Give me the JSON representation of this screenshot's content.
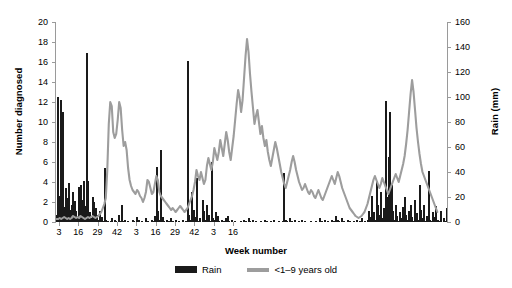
{
  "chart_data": {
    "type": "bar",
    "title": "",
    "xlabel": "Week number",
    "ylabel": "Number diagnosed",
    "ylabel_right": "Rain (mm)",
    "ylim": [
      0,
      20
    ],
    "ylim_right": [
      0,
      160
    ],
    "yticks": [
      0,
      2,
      4,
      6,
      8,
      10,
      12,
      14,
      16,
      18,
      20
    ],
    "yticks_right": [
      0,
      20,
      40,
      60,
      80,
      100,
      120,
      140,
      160
    ],
    "xticks": [
      3,
      16,
      29,
      42,
      3,
      16,
      29,
      42,
      3,
      16
    ],
    "xtick_positions": [
      3,
      16,
      29,
      42,
      55,
      68,
      81,
      94,
      107,
      120
    ],
    "grid": false,
    "legend_position": "bottom-center",
    "series": [
      {
        "name": "Rain",
        "type": "bar",
        "color": "#1a1a1a",
        "axis": "right",
        "unit": "mm",
        "values": [
          6,
          100,
          21,
          98,
          88,
          12,
          27,
          19,
          31,
          10,
          14,
          24,
          17,
          9,
          5,
          28,
          30,
          18,
          33,
          13,
          135,
          33,
          8,
          3,
          20,
          16,
          11,
          6,
          2,
          9,
          4,
          1,
          43,
          2,
          1,
          0,
          1,
          3,
          0,
          2,
          1,
          0,
          6,
          1,
          14,
          1,
          2,
          0,
          1,
          0,
          0,
          2,
          1,
          0,
          4,
          2,
          0,
          1,
          0,
          0,
          3,
          1,
          0,
          0,
          2,
          1,
          5,
          44,
          9,
          2,
          58,
          4,
          1,
          0,
          2,
          1,
          0,
          3,
          1,
          0,
          2,
          0,
          1,
          0,
          0,
          2,
          0,
          1,
          129,
          6,
          2,
          24,
          10,
          4,
          35,
          1,
          3,
          0,
          18,
          9,
          2,
          14,
          6,
          1,
          48,
          3,
          2,
          8,
          5,
          1,
          0,
          2,
          1,
          0,
          3,
          5,
          1,
          0,
          2,
          0,
          1,
          0,
          0,
          0,
          1,
          0,
          2,
          1,
          0,
          3,
          1,
          0,
          2,
          0,
          1,
          0,
          0,
          1,
          0,
          0,
          2,
          1,
          0,
          0,
          1,
          0,
          2,
          0,
          0,
          1,
          0,
          0,
          1,
          39,
          2,
          1,
          0,
          3,
          1,
          0,
          2,
          0,
          0,
          1,
          0,
          2,
          0,
          1,
          0,
          0,
          0,
          1,
          0,
          0,
          1,
          0,
          0,
          3,
          1,
          0,
          2,
          0,
          1,
          0,
          0,
          2,
          1,
          0,
          5,
          2,
          1,
          0,
          3,
          1,
          0,
          0,
          2,
          1,
          0,
          0,
          1,
          0,
          2,
          0,
          1,
          3,
          0,
          1,
          0,
          2,
          9,
          4,
          21,
          8,
          2,
          33,
          14,
          6,
          24,
          3,
          11,
          97,
          20,
          52,
          88,
          30,
          9,
          2,
          14,
          5,
          1,
          8,
          3,
          12,
          20,
          6,
          2,
          9,
          14,
          4,
          1,
          18,
          7,
          2,
          30,
          10,
          3,
          14,
          1,
          5,
          41,
          2,
          1,
          8,
          4,
          13,
          2,
          1,
          9,
          0,
          3,
          1,
          11
        ]
      },
      {
        "name": "<1–9 years old",
        "type": "line",
        "color": "#9d9d9d",
        "axis": "left",
        "unit": "cases",
        "values": [
          0.3,
          0.3,
          0.4,
          0.3,
          0.4,
          0.5,
          0.4,
          0.3,
          0.4,
          0.3,
          0.4,
          0.6,
          0.5,
          0.4,
          0.5,
          0.4,
          0.6,
          0.5,
          0.4,
          0.3,
          0.4,
          0.5,
          0.4,
          0.5,
          0.6,
          0.5,
          0.4,
          0.5,
          0.6,
          0.8,
          1.0,
          1.4,
          1.8,
          2.4,
          5.2,
          9.8,
          12.0,
          11.6,
          9.0,
          8.4,
          8.8,
          10.2,
          12.0,
          11.4,
          9.2,
          7.6,
          8.0,
          7.2,
          5.4,
          4.2,
          3.6,
          3.2,
          3.0,
          2.8,
          3.2,
          3.0,
          2.6,
          2.4,
          2.0,
          2.4,
          3.0,
          4.2,
          4.0,
          3.4,
          2.8,
          3.0,
          3.8,
          4.6,
          4.2,
          3.0,
          2.6,
          2.4,
          2.2,
          2.0,
          1.8,
          1.6,
          1.4,
          1.2,
          1.4,
          1.2,
          1.0,
          1.2,
          1.4,
          1.6,
          1.4,
          1.2,
          1.0,
          1.2,
          1.4,
          1.8,
          2.2,
          2.6,
          3.2,
          4.0,
          5.2,
          4.6,
          4.2,
          5.0,
          4.4,
          3.8,
          4.2,
          5.6,
          6.4,
          5.8,
          5.2,
          6.0,
          7.4,
          6.8,
          6.2,
          7.0,
          8.2,
          7.4,
          6.6,
          7.8,
          9.0,
          8.2,
          7.0,
          6.2,
          7.4,
          8.6,
          10.2,
          11.8,
          13.2,
          12.4,
          11.0,
          12.2,
          14.4,
          16.6,
          18.3,
          17.0,
          14.8,
          13.0,
          11.4,
          9.8,
          10.6,
          11.2,
          10.0,
          8.8,
          9.6,
          8.4,
          7.6,
          8.2,
          7.0,
          6.2,
          5.6,
          6.4,
          7.2,
          8.0,
          7.4,
          6.6,
          5.8,
          5.0,
          4.4,
          3.8,
          3.4,
          4.0,
          4.6,
          5.2,
          6.0,
          6.6,
          6.0,
          5.2,
          4.6,
          4.0,
          3.6,
          3.2,
          3.4,
          3.8,
          3.4,
          3.0,
          2.8,
          3.2,
          3.0,
          2.6,
          2.4,
          2.8,
          3.2,
          2.8,
          2.4,
          2.2,
          2.6,
          3.0,
          3.4,
          3.8,
          4.2,
          4.6,
          4.2,
          3.8,
          4.4,
          5.0,
          4.6,
          4.0,
          3.4,
          3.0,
          2.6,
          2.2,
          1.8,
          1.4,
          1.2,
          1.0,
          0.8,
          0.6,
          0.5,
          0.4,
          0.5,
          0.6,
          0.8,
          1.0,
          1.4,
          1.8,
          2.4,
          3.0,
          3.6,
          4.2,
          4.6,
          4.2,
          3.8,
          3.4,
          3.8,
          4.4,
          4.0,
          3.6,
          3.2,
          2.8,
          3.2,
          3.6,
          4.0,
          4.4,
          4.8,
          4.4,
          4.0,
          4.6,
          5.2,
          5.8,
          6.6,
          7.8,
          9.2,
          11.0,
          12.8,
          14.2,
          13.0,
          11.2,
          9.4,
          8.0,
          6.8,
          5.8,
          5.0,
          4.6,
          4.2,
          3.8,
          3.4,
          3.0,
          2.6,
          2.2,
          1.8,
          1.4,
          1.0
        ]
      }
    ],
    "legend": [
      {
        "label": "Rain",
        "marker": "bar",
        "color": "#1a1a1a"
      },
      {
        "label": "<1–9 years old",
        "marker": "line",
        "color": "#9d9d9d"
      }
    ]
  }
}
